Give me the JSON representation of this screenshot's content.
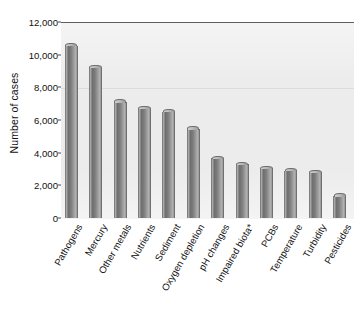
{
  "chart_data": {
    "type": "bar",
    "title": "",
    "xlabel": "",
    "ylabel": "Number of cases",
    "ylim": [
      0,
      12000
    ],
    "ytick_labels": [
      "12,000",
      "10,000",
      "8,000",
      "6,000",
      "4,000",
      "2,000",
      "0"
    ],
    "ytick_values": [
      12000,
      10000,
      8000,
      6000,
      4000,
      2000,
      0
    ],
    "grid": false,
    "legend": null,
    "orientation": "vertical",
    "categories": [
      "Pathogens",
      "Mercury",
      "Other metals",
      "Nutrients",
      "Sediment",
      "Oxygen depletion",
      "pH changes",
      "Impaired biota*",
      "PCBs",
      "Temperature",
      "Turbidity",
      "Pesticides"
    ],
    "values": [
      10550,
      9200,
      7100,
      6700,
      6500,
      5450,
      3650,
      3300,
      3050,
      2900,
      2800,
      1350
    ],
    "bar_color": "#8c8c8c",
    "plot_background": "#ececec",
    "axis_color": "#4a4a4a"
  },
  "axis": {
    "y_title": "Number of cases"
  },
  "footnote": "*"
}
